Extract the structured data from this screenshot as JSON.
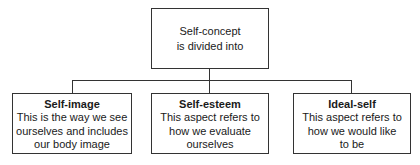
{
  "diagram": {
    "root": {
      "lines": [
        "Self-concept",
        "is divided into"
      ]
    },
    "children": [
      {
        "title": "Self-image",
        "lines": [
          "This is the way we see",
          "ourselves and includes",
          "our body image"
        ]
      },
      {
        "title": "Self-esteem",
        "lines": [
          "This aspect refers to",
          "how we evaluate",
          "ourselves"
        ]
      },
      {
        "title": "Ideal-self",
        "lines": [
          "This aspect refers to",
          "how we would like",
          "to be"
        ]
      }
    ]
  }
}
